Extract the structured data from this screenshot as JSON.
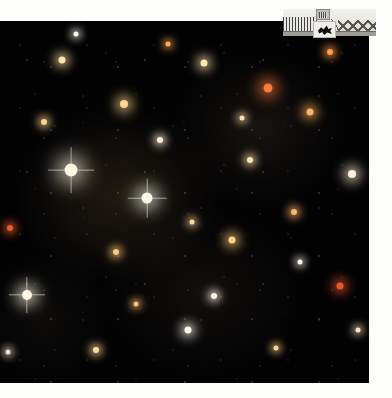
{
  "page": {
    "background_color": "#fdfdfc",
    "width": 392,
    "height": 398
  },
  "plate": {
    "name": "star-field-plate",
    "description": "Dense star field photograph",
    "background_color": "#020203",
    "bounds": {
      "x": 0,
      "y": 21,
      "width": 369,
      "height": 362
    },
    "star_colors": {
      "white": "#fffdf6",
      "cream": "#fff0cd",
      "yellow": "#ffd98a",
      "orange": "#ff9a45",
      "red": "#e8552a",
      "blue_white": "#dfe9ff"
    },
    "bright_stars": [
      {
        "name": "bright-star-1",
        "x": 71,
        "y": 170,
        "size": 13,
        "color": "#fff6e0",
        "spike": true
      },
      {
        "name": "bright-star-2",
        "x": 147,
        "y": 198,
        "size": 11,
        "color": "#f6f8e6",
        "spike": true
      },
      {
        "name": "bright-star-3",
        "x": 27,
        "y": 295,
        "size": 10,
        "color": "#fff7e4",
        "spike": true
      },
      {
        "name": "bright-star-4",
        "x": 268,
        "y": 88,
        "size": 9,
        "color": "#ff7a3a",
        "spike": false
      },
      {
        "name": "bright-star-5",
        "x": 310,
        "y": 112,
        "size": 7,
        "color": "#ffb05c",
        "spike": false
      },
      {
        "name": "bright-star-6",
        "x": 124,
        "y": 104,
        "size": 8,
        "color": "#ffd88e",
        "spike": false
      },
      {
        "name": "bright-star-7",
        "x": 204,
        "y": 63,
        "size": 7,
        "color": "#ffe7b0",
        "spike": false
      },
      {
        "name": "bright-star-8",
        "x": 340,
        "y": 286,
        "size": 7,
        "color": "#e8552a",
        "spike": false
      },
      {
        "name": "bright-star-9",
        "x": 352,
        "y": 174,
        "size": 8,
        "color": "#fff3d6",
        "spike": false
      },
      {
        "name": "bright-star-10",
        "x": 62,
        "y": 60,
        "size": 7,
        "color": "#ffe2a6",
        "spike": false
      },
      {
        "name": "bright-star-11",
        "x": 232,
        "y": 240,
        "size": 7,
        "color": "#ffcf82",
        "spike": false
      },
      {
        "name": "bright-star-12",
        "x": 188,
        "y": 330,
        "size": 7,
        "color": "#fff8ea",
        "spike": false
      },
      {
        "name": "bright-star-13",
        "x": 96,
        "y": 350,
        "size": 6,
        "color": "#ffdb96",
        "spike": false
      },
      {
        "name": "bright-star-14",
        "x": 294,
        "y": 212,
        "size": 6,
        "color": "#ffb76a",
        "spike": false
      },
      {
        "name": "bright-star-15",
        "x": 10,
        "y": 228,
        "size": 6,
        "color": "#e65a2e",
        "spike": false
      },
      {
        "name": "bright-star-16",
        "x": 160,
        "y": 140,
        "size": 6,
        "color": "#fff2d2",
        "spike": false
      },
      {
        "name": "bright-star-17",
        "x": 250,
        "y": 160,
        "size": 6,
        "color": "#ffe3ab",
        "spike": false
      },
      {
        "name": "bright-star-18",
        "x": 44,
        "y": 122,
        "size": 6,
        "color": "#ffd38a",
        "spike": false
      },
      {
        "name": "bright-star-19",
        "x": 330,
        "y": 52,
        "size": 6,
        "color": "#ff9c4a",
        "spike": false
      },
      {
        "name": "bright-star-20",
        "x": 214,
        "y": 296,
        "size": 6,
        "color": "#fff6e6",
        "spike": false
      },
      {
        "name": "bright-star-21",
        "x": 116,
        "y": 252,
        "size": 6,
        "color": "#ffc977",
        "spike": false
      },
      {
        "name": "bright-star-22",
        "x": 358,
        "y": 330,
        "size": 5,
        "color": "#ffe9bf",
        "spike": false
      },
      {
        "name": "bright-star-23",
        "x": 76,
        "y": 34,
        "size": 5,
        "color": "#fff9ee",
        "spike": false
      },
      {
        "name": "bright-star-24",
        "x": 276,
        "y": 348,
        "size": 5,
        "color": "#ffd18a",
        "spike": false
      },
      {
        "name": "bright-star-25",
        "x": 168,
        "y": 44,
        "size": 5,
        "color": "#ffab58",
        "spike": false
      },
      {
        "name": "bright-star-26",
        "x": 8,
        "y": 352,
        "size": 5,
        "color": "#fff4dd",
        "spike": false
      },
      {
        "name": "bright-star-27",
        "x": 242,
        "y": 118,
        "size": 5,
        "color": "#ffe0a2",
        "spike": false
      },
      {
        "name": "bright-star-28",
        "x": 136,
        "y": 304,
        "size": 5,
        "color": "#ffc06e",
        "spike": false
      },
      {
        "name": "bright-star-29",
        "x": 300,
        "y": 262,
        "size": 5,
        "color": "#fff7ea",
        "spike": false
      },
      {
        "name": "bright-star-30",
        "x": 192,
        "y": 222,
        "size": 5,
        "color": "#ffd6a0",
        "spike": false
      }
    ]
  },
  "inset": {
    "name": "architectural-inset-photo",
    "description": "Grayscale photograph of a trussed arcade structure",
    "bounds": {
      "x": 283,
      "y": 9,
      "width": 93,
      "height": 27
    },
    "tone": "grayscale"
  },
  "badge": {
    "name": "figure-badge",
    "description": "Small light panel containing a dark silhouette",
    "bounds": {
      "x": 313,
      "y": 21,
      "width": 23,
      "height": 17
    },
    "background_color": "#f0eeea",
    "figure_color": "#111110"
  }
}
